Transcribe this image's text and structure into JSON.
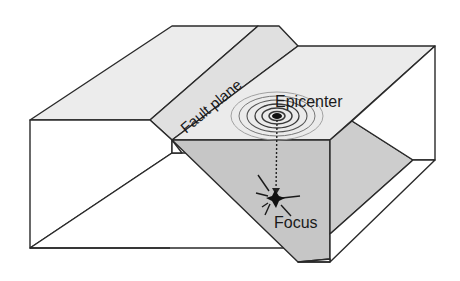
{
  "diagram": {
    "labels": {
      "fault_plane": "Fault plane",
      "epicenter": "Epicenter",
      "focus": "Focus"
    },
    "colors": {
      "outline": "#2a2a2a",
      "top_surface": "#ebebeb",
      "fault_strip": "#e2e2e2",
      "fault_face": "#c4c4c4",
      "side_face": "#ffffff",
      "rings": "#3a3a3a"
    }
  }
}
